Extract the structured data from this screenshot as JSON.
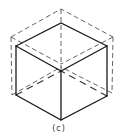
{
  "figure": {
    "caption": "(c)",
    "colors": {
      "background": "#ffffff",
      "solid_line": "#1a1a1a",
      "dashed_line": "#555555"
    }
  }
}
